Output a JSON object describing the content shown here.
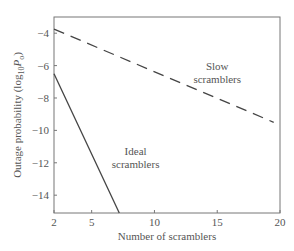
{
  "chart_data": {
    "type": "line",
    "title": "",
    "xlabel": "Number of scramblers",
    "ylabel": "Outage probability (log10 Po)",
    "ylabel_parts": {
      "main": "Outage probability (log",
      "sub1": "10",
      "mid": "P",
      "sub2": "o",
      "end": ")"
    },
    "xlim": [
      2,
      20
    ],
    "ylim": [
      -15.1,
      -3
    ],
    "xticks": [
      2,
      5,
      10,
      15,
      20
    ],
    "xtick_labels": [
      "2",
      "5",
      "10",
      "15",
      "20"
    ],
    "yticks": [
      -4,
      -6,
      -8,
      -10,
      -12,
      -14
    ],
    "ytick_labels": [
      "−4",
      "−6",
      "−8",
      "−10",
      "−12",
      "−14"
    ],
    "grid": false,
    "legend": "none (inline annotations)",
    "series": [
      {
        "name": "Slow scramblers",
        "style": "dashed",
        "x": [
          2,
          19.5
        ],
        "y": [
          -3.75,
          -9.5
        ]
      },
      {
        "name": "Ideal scramblers",
        "style": "solid",
        "x": [
          2,
          7.2
        ],
        "y": [
          -6.5,
          -15.1
        ]
      }
    ],
    "annotations": [
      {
        "text_line1": "Slow",
        "text_line2": "scramblers",
        "x": 15,
        "y": -6.3
      },
      {
        "text_line1": "Ideal",
        "text_line2": "scramblers",
        "x": 8.5,
        "y": -11.5
      }
    ]
  },
  "colors": {
    "axis": "#666666",
    "line": "#444444",
    "text": "#555555"
  }
}
